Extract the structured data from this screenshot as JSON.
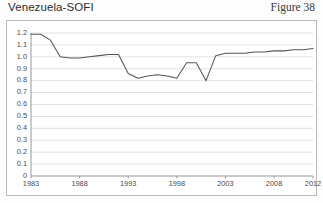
{
  "header": {
    "title": "Venezuela-SOFI",
    "figure_number": "Figure 38"
  },
  "chart_data": {
    "type": "line",
    "title": "Venezuela-SOFI",
    "subtitle": "Figure 38",
    "xlabel": "",
    "ylabel": "",
    "grid": true,
    "legend": false,
    "line_color": "#555555",
    "xlim": [
      1983,
      2012
    ],
    "ylim": [
      0,
      1.2
    ],
    "ytick_labels": [
      "1.2",
      "1.1",
      "1.0",
      "0.9",
      "0.8",
      "0.7",
      "0.6",
      "0.5",
      "0.4",
      "0.3",
      "0.2",
      "0.1",
      "0"
    ],
    "ytick_values": [
      1.2,
      1.1,
      1.0,
      0.9,
      0.8,
      0.7,
      0.6,
      0.5,
      0.4,
      0.3,
      0.2,
      0.1,
      0
    ],
    "xtick_labels": [
      "1983",
      "1988",
      "1993",
      "1998",
      "2003",
      "2008",
      "2012"
    ],
    "xtick_values": [
      1983,
      1988,
      1993,
      1998,
      2003,
      2008,
      2012
    ],
    "x": [
      1983,
      1984,
      1985,
      1986,
      1987,
      1988,
      1989,
      1990,
      1991,
      1992,
      1993,
      1994,
      1995,
      1996,
      1997,
      1998,
      1999,
      2000,
      2001,
      2002,
      2003,
      2004,
      2005,
      2006,
      2007,
      2008,
      2009,
      2010,
      2011,
      2012
    ],
    "values": [
      1.19,
      1.19,
      1.14,
      1.0,
      0.99,
      0.99,
      1.0,
      1.01,
      1.02,
      1.02,
      0.86,
      0.82,
      0.84,
      0.85,
      0.84,
      0.82,
      0.95,
      0.95,
      0.8,
      1.01,
      1.03,
      1.03,
      1.03,
      1.04,
      1.04,
      1.05,
      1.05,
      1.06,
      1.06,
      1.07
    ],
    "series": [
      {
        "name": "Venezuela-SOFI",
        "values": [
          1.19,
          1.19,
          1.14,
          1.0,
          0.99,
          0.99,
          1.0,
          1.01,
          1.02,
          1.02,
          0.86,
          0.82,
          0.84,
          0.85,
          0.84,
          0.82,
          0.95,
          0.95,
          0.8,
          1.01,
          1.03,
          1.03,
          1.03,
          1.04,
          1.04,
          1.05,
          1.05,
          1.06,
          1.06,
          1.07
        ]
      }
    ]
  }
}
